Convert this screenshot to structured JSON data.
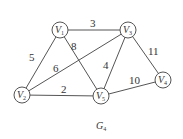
{
  "graph": {
    "title": "G",
    "title_sub": "4",
    "nodes": [
      {
        "id": "V1",
        "label": "V",
        "sub": "1",
        "x": 60,
        "y": 30
      },
      {
        "id": "V2",
        "label": "V",
        "sub": "2",
        "x": 22,
        "y": 95
      },
      {
        "id": "V3",
        "label": "V",
        "sub": "3",
        "x": 128,
        "y": 30
      },
      {
        "id": "V4",
        "label": "V",
        "sub": "4",
        "x": 163,
        "y": 80
      },
      {
        "id": "V5",
        "label": "V",
        "sub": "5",
        "x": 101,
        "y": 96
      }
    ],
    "edges": [
      {
        "from": "V1",
        "to": "V3",
        "weight": "3"
      },
      {
        "from": "V1",
        "to": "V2",
        "weight": "5"
      },
      {
        "from": "V1",
        "to": "V5",
        "weight": "8"
      },
      {
        "from": "V2",
        "to": "V3",
        "weight": "6"
      },
      {
        "from": "V3",
        "to": "V5",
        "weight": "4"
      },
      {
        "from": "V3",
        "to": "V4",
        "weight": "11"
      },
      {
        "from": "V2",
        "to": "V5",
        "weight": "2"
      },
      {
        "from": "V5",
        "to": "V4",
        "weight": "10"
      }
    ]
  }
}
